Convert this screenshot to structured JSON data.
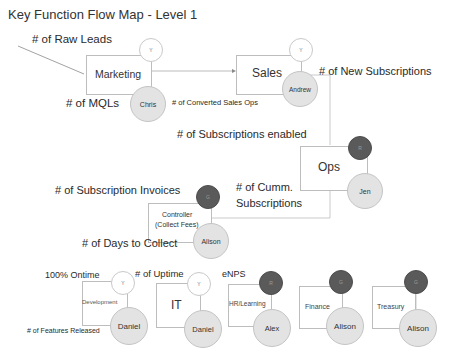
{
  "title": "Key Function Flow Map - Level 1",
  "colors": {
    "box_border": "#bdbdbd",
    "owner_fill": "#e3e3e3",
    "status_dark": "#5a5a5a",
    "status_light": "#ffffff",
    "connector": "#aaaaaa"
  },
  "functions": {
    "marketing": {
      "label": "Marketing",
      "status": "Y",
      "owner": "Chris"
    },
    "sales": {
      "label": "Sales",
      "status": "Y",
      "owner": "Andrew"
    },
    "ops": {
      "label": "Ops",
      "status": "R",
      "owner": "Jen"
    },
    "controller": {
      "label_line1": "Controller",
      "label_line2": "(Collect Fees)",
      "status": "G",
      "owner": "Alison"
    },
    "development": {
      "label": "Development",
      "status": "Y",
      "owner": "Daniel"
    },
    "it": {
      "label": "IT",
      "status": "Y",
      "owner": "Daniel"
    },
    "hr": {
      "label": "HR/Learning",
      "status": "R",
      "owner": "Alex"
    },
    "finance": {
      "label": "Finance",
      "status": "G",
      "owner": "Alison"
    },
    "treasury": {
      "label": "Treasury",
      "status": "G",
      "owner": "Alison"
    }
  },
  "metrics": {
    "raw_leads": "# of Raw Leads",
    "mqls": "# of  MQLs",
    "converted_sales_ops": "# of  Converted Sales Ops",
    "new_subscriptions": "# of New Subscriptions",
    "subscriptions_enabled": "# of Subscriptions enabled",
    "subscription_invoices": "# of Subscription Invoices",
    "cumm_subscriptions_line1": "# of Cumm.",
    "cumm_subscriptions_line2": "Subscriptions",
    "days_to_collect": "# of Days to Collect",
    "ontime": "100% Ontime",
    "uptime": "# of Uptime",
    "enps": "eNPS",
    "features_released": "# of Features Released"
  }
}
